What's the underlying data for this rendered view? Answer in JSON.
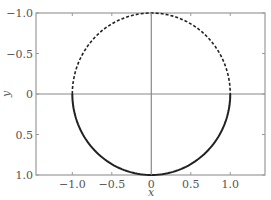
{
  "chart_data": {
    "type": "line",
    "title": "",
    "xlabel": "x",
    "ylabel": "y",
    "xlim": [
      -1.46,
      1.44
    ],
    "ylim": [
      1.0,
      -1.0
    ],
    "y_inverted": true,
    "grid": false,
    "legend": null,
    "x_ticks": [
      -1.0,
      -0.5,
      0,
      0.5,
      1.0
    ],
    "x_tick_labels": [
      "−1.0",
      "−0.5",
      "0",
      "0.5",
      "1.0"
    ],
    "y_ticks": [
      -1.0,
      -0.5,
      0,
      0.5,
      1.0
    ],
    "y_tick_labels": [
      "−1.0",
      "−0.5",
      "0",
      "0.5",
      "1.0"
    ],
    "reference_lines": [
      {
        "orientation": "horizontal",
        "value": 0
      },
      {
        "orientation": "vertical",
        "value": 0
      }
    ],
    "series": [
      {
        "name": "upper semicircle (y<0)",
        "shape": "arc",
        "center": [
          0,
          0
        ],
        "radius": 1.0,
        "theta_range_deg": [
          180,
          360
        ],
        "style": "dashed",
        "color": "#222222"
      },
      {
        "name": "lower semicircle (y>0)",
        "shape": "arc",
        "center": [
          0,
          0
        ],
        "radius": 1.0,
        "theta_range_deg": [
          0,
          180
        ],
        "style": "solid",
        "color": "#222222"
      }
    ]
  },
  "colors": {
    "frame": "#9a9a9a",
    "axis_lines": "#888888",
    "curve": "#222222",
    "text": "#555555"
  }
}
